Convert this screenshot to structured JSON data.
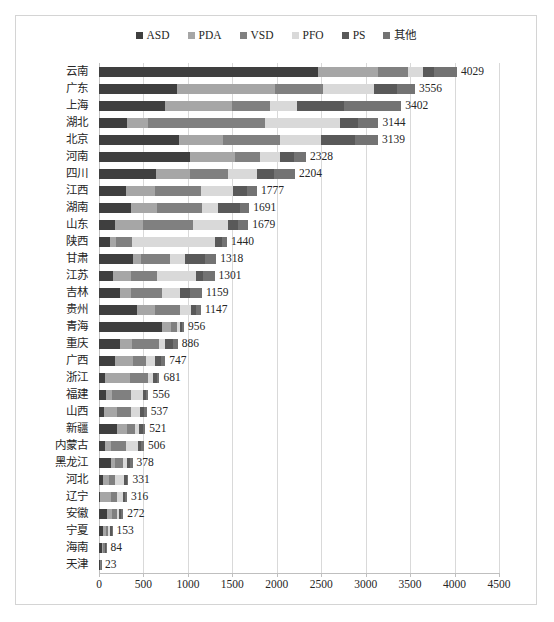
{
  "chart_data": {
    "type": "bar",
    "orientation": "horizontal",
    "stacked": true,
    "title": "",
    "xlabel": "",
    "ylabel": "",
    "xlim": [
      0,
      4500
    ],
    "xticks": [
      0,
      500,
      1000,
      1500,
      2000,
      2500,
      3000,
      3500,
      4000,
      4500
    ],
    "xtick_labels": [
      "0",
      "500",
      "1000",
      "1500",
      "2000",
      "2500",
      "3000",
      "3500",
      "4000",
      "4500"
    ],
    "grid": true,
    "legend_position": "top-center",
    "legend": [
      "ASD",
      "PDA",
      "VSD",
      "PFO",
      "PS",
      "其他"
    ],
    "series_colors": [
      "#3f3f3f",
      "#a6a6a6",
      "#808080",
      "#d9d9d9",
      "#595959",
      "#737373"
    ],
    "categories": [
      "云南",
      "广东",
      "上海",
      "湖北",
      "北京",
      "河南",
      "四川",
      "江西",
      "湖南",
      "山东",
      "陕西",
      "甘肃",
      "江苏",
      "吉林",
      "贵州",
      "青海",
      "重庆",
      "广西",
      "浙江",
      "福建",
      "山西",
      "新疆",
      "内蒙古",
      "黑龙江",
      "河北",
      "辽宁",
      "安徽",
      "宁夏",
      "海南",
      "天津"
    ],
    "totals": [
      4029,
      3556,
      3402,
      3144,
      3139,
      2328,
      2204,
      1777,
      1691,
      1679,
      1440,
      1318,
      1301,
      1159,
      1147,
      956,
      886,
      747,
      681,
      556,
      537,
      521,
      506,
      378,
      331,
      316,
      272,
      153,
      84,
      23
    ],
    "total_labels": [
      "4029",
      "3556",
      "3402",
      "3144",
      "3139",
      "2328",
      "2204",
      "1777",
      "1691",
      "1679",
      "1440",
      "1318",
      "1301",
      "1159",
      "1147",
      "956",
      "886",
      "747",
      "681",
      "556",
      "537",
      "521",
      "506",
      "378",
      "331",
      "316",
      "272",
      "153",
      "84",
      "23"
    ],
    "series": [
      {
        "name": "ASD",
        "values": [
          2461,
          875,
          740,
          310,
          905,
          1025,
          638,
          300,
          365,
          175,
          120,
          380,
          160,
          232,
          430,
          710,
          240,
          175,
          70,
          75,
          60,
          200,
          70,
          130,
          40,
          15,
          95,
          40,
          35,
          12
        ]
      },
      {
        "name": "PDA",
        "values": [
          680,
          1100,
          760,
          245,
          495,
          500,
          390,
          330,
          285,
          320,
          70,
          95,
          195,
          130,
          195,
          95,
          130,
          205,
          275,
          75,
          145,
          120,
          65,
          45,
          75,
          120,
          50,
          35,
          12,
          3
        ]
      },
      {
        "name": "VSD",
        "values": [
          340,
          540,
          420,
          1310,
          640,
          290,
          420,
          520,
          510,
          560,
          180,
          320,
          300,
          345,
          285,
          70,
          310,
          150,
          205,
          215,
          160,
          90,
          170,
          100,
          60,
          70,
          55,
          28,
          16,
          3
        ]
      },
      {
        "name": "PFO",
        "values": [
          160,
          580,
          310,
          845,
          460,
          225,
          330,
          360,
          180,
          395,
          940,
          170,
          435,
          210,
          125,
          35,
          60,
          105,
          55,
          130,
          100,
          45,
          130,
          35,
          105,
          70,
          30,
          20,
          10,
          2
        ]
      },
      {
        "name": "PS",
        "values": [
          125,
          255,
          530,
          205,
          375,
          155,
          195,
          150,
          241,
          109,
          75,
          228,
          80,
          112,
          52,
          26,
          96,
          62,
          46,
          31,
          42,
          36,
          41,
          38,
          31,
          21,
          22,
          20,
          6,
          2
        ]
      },
      {
        "name": "其他",
        "values": [
          263,
          206,
          642,
          229,
          264,
          133,
          231,
          117,
          110,
          120,
          55,
          125,
          131,
          130,
          60,
          20,
          50,
          50,
          30,
          30,
          30,
          30,
          30,
          30,
          20,
          20,
          20,
          10,
          5,
          1
        ]
      }
    ]
  }
}
